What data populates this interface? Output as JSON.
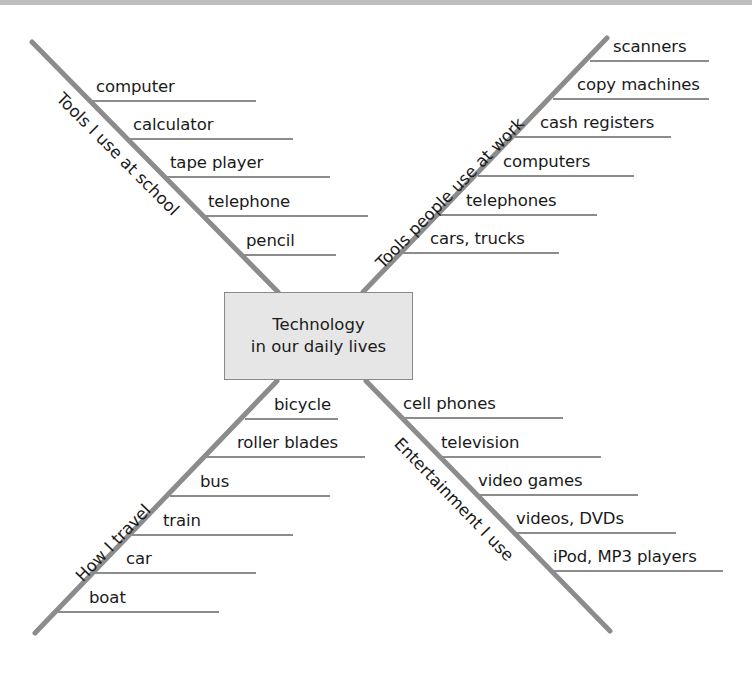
{
  "center": {
    "line1": "Technology",
    "line2": "in our daily lives"
  },
  "branches": {
    "school": {
      "label": "Tools I use at school",
      "items": [
        "computer",
        "calculator",
        "tape player",
        "telephone",
        "pencil"
      ]
    },
    "work": {
      "label": "Tools people use at work",
      "items": [
        "scanners",
        "copy machines",
        "cash registers",
        "computers",
        "telephones",
        "cars, trucks"
      ]
    },
    "travel": {
      "label": "How I travel",
      "items": [
        "bicycle",
        "roller blades",
        "bus",
        "train",
        "car",
        "boat"
      ]
    },
    "entertainment": {
      "label": "Entertainment I use",
      "items": [
        "cell phones",
        "television",
        "video games",
        "videos, DVDs",
        "iPod, MP3 players"
      ]
    }
  },
  "colors": {
    "line": "#8c8c8c",
    "box_fill": "#e6e6e6",
    "box_border": "#8a8a8a",
    "text": "#1a1a1a"
  }
}
